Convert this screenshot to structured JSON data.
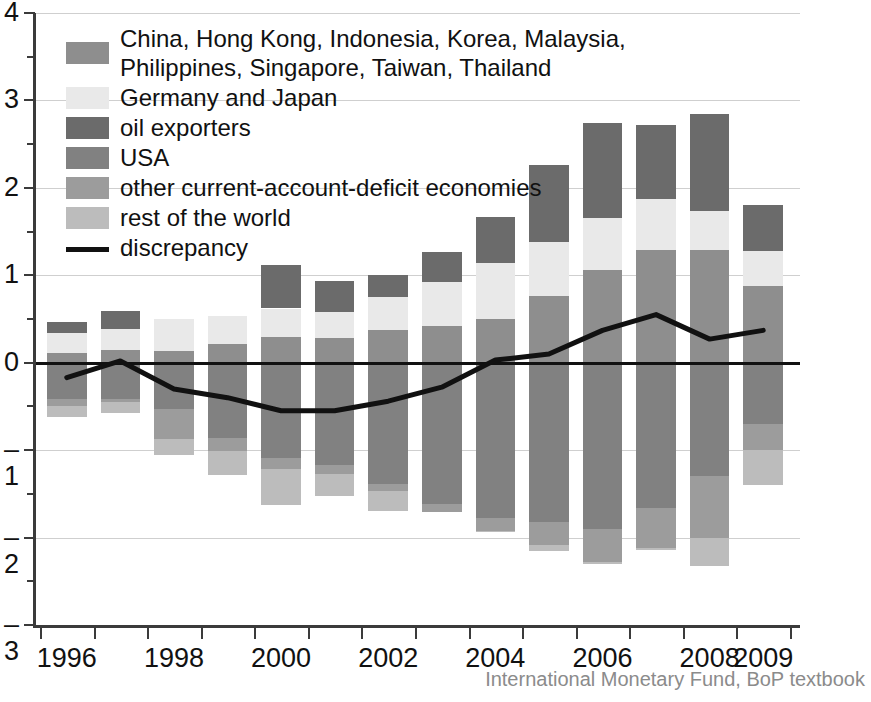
{
  "figure": {
    "credit": "International Monetary Fund, BoP textbook"
  },
  "legend": {
    "position": "top-left",
    "items": [
      {
        "label": "China, Hong Kong, Indonesia, Korea, Malaysia,\nPhilippines, Singapore, Taiwan, Thailand",
        "color": "#8e8e8e",
        "icon": "legend-swatch"
      },
      {
        "label": "Germany and Japan",
        "color": "#e9e9e9",
        "icon": "legend-swatch"
      },
      {
        "label": "oil exporters",
        "color": "#6b6b6b",
        "icon": "legend-swatch"
      },
      {
        "label": "USA",
        "color": "#818181",
        "icon": "legend-swatch"
      },
      {
        "label": "other current-account-deficit economies",
        "color": "#9c9c9c",
        "icon": "legend-swatch"
      },
      {
        "label": "rest of the world",
        "color": "#bcbcbc",
        "icon": "legend-swatch"
      },
      {
        "label": "discrepancy",
        "color": "#111111",
        "icon": "legend-line"
      }
    ]
  },
  "chart_data": {
    "type": "bar",
    "stacked": true,
    "title": "",
    "subtitle": "",
    "xlabel": "",
    "ylabel": "",
    "ylim": [
      -3,
      4
    ],
    "yticks": [
      -3,
      -2,
      -1,
      0,
      1,
      2,
      3,
      4
    ],
    "ytick_labels": [
      "–3",
      "–2",
      "–1",
      "0",
      "1",
      "2",
      "3",
      "4"
    ],
    "yminor_ticks": [
      -2.5,
      -1.5,
      -0.5,
      0.5,
      1.5,
      2.5,
      3.5
    ],
    "grid": "horizontal",
    "categories": [
      1996,
      1997,
      1998,
      1999,
      2000,
      2001,
      2002,
      2003,
      2004,
      2005,
      2006,
      2007,
      2008,
      2009
    ],
    "xtick_labels": [
      "1996",
      "1998",
      "2000",
      "2002",
      "2004",
      "2006",
      "2008",
      "2009"
    ],
    "xtick_categories": [
      1996,
      1998,
      2000,
      2002,
      2004,
      2006,
      2008,
      2009
    ],
    "series": [
      {
        "name": "China, Hong Kong, Indonesia, Korea, Malaysia, Philippines, Singapore, Taiwan, Thailand",
        "color": "#8e8e8e",
        "values": [
          0.11,
          0.14,
          0.13,
          0.21,
          0.29,
          0.28,
          0.37,
          0.42,
          0.5,
          0.76,
          1.06,
          1.29,
          1.29,
          0.88
        ]
      },
      {
        "name": "Germany and Japan",
        "color": "#e9e9e9",
        "values": [
          0.23,
          0.24,
          0.37,
          0.33,
          0.33,
          0.3,
          0.38,
          0.5,
          0.64,
          0.62,
          0.6,
          0.58,
          0.45,
          0.4
        ]
      },
      {
        "name": "oil exporters",
        "color": "#6b6b6b",
        "values": [
          0.13,
          0.21,
          0.0,
          0.0,
          0.5,
          0.36,
          0.25,
          0.35,
          0.53,
          0.88,
          1.08,
          0.85,
          1.1,
          0.52
        ]
      },
      {
        "name": "USA",
        "color": "#818181",
        "values": [
          -0.42,
          -0.41,
          -0.53,
          -0.86,
          -1.09,
          -1.17,
          -1.39,
          -1.62,
          -1.78,
          -1.82,
          -1.9,
          -1.66,
          -1.3,
          -0.7
        ]
      },
      {
        "name": "other current-account-deficit economies",
        "color": "#9c9c9c",
        "values": [
          -0.08,
          -0.04,
          -0.34,
          -0.15,
          -0.13,
          -0.1,
          -0.08,
          -0.09,
          -0.15,
          -0.27,
          -0.38,
          -0.46,
          -0.7,
          -0.3
        ]
      },
      {
        "name": "rest of the world",
        "color": "#bcbcbc",
        "values": [
          -0.12,
          -0.12,
          -0.18,
          -0.27,
          -0.41,
          -0.25,
          -0.23,
          -0.0,
          -0.01,
          -0.06,
          -0.02,
          -0.02,
          -0.32,
          -0.4
        ]
      }
    ],
    "line_series": {
      "name": "discrepancy",
      "color": "#111111",
      "values": [
        -0.17,
        0.02,
        -0.3,
        -0.4,
        -0.55,
        -0.55,
        -0.44,
        -0.28,
        0.03,
        0.1,
        0.37,
        0.55,
        0.27,
        0.37
      ]
    }
  }
}
